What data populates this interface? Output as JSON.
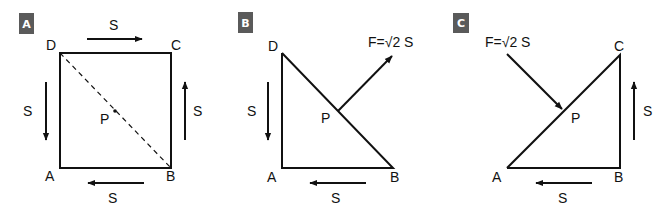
{
  "panels": [
    {
      "id": "A",
      "badge": "A",
      "vertices": {
        "A": "A",
        "B": "B",
        "C": "C",
        "D": "D"
      },
      "point": "P",
      "forces": {
        "top": "S",
        "left": "S",
        "right": "S",
        "bottom": "S"
      },
      "description": "Square ABCD with shear flows S on all four sides and dashed diagonal DB through point P"
    },
    {
      "id": "B",
      "badge": "B",
      "vertices": {
        "A": "A",
        "B": "B",
        "D": "D"
      },
      "point": "P",
      "forces": {
        "left": "S",
        "bottom": "S"
      },
      "resultant": "F=√2 S",
      "description": "Triangle ABD with resultant force F pointing up-right from P on the hypotenuse"
    },
    {
      "id": "C",
      "badge": "C",
      "vertices": {
        "A": "A",
        "B": "B",
        "C": "C"
      },
      "point": "P",
      "forces": {
        "right": "S",
        "bottom": "S"
      },
      "resultant": "F=√2 S",
      "description": "Triangle ABC with resultant force F pointing down-right onto P on the hypotenuse"
    }
  ],
  "colors": {
    "line": "#111111",
    "badge_bg": "#5a5a5a",
    "badge_text": "#ffffff"
  }
}
